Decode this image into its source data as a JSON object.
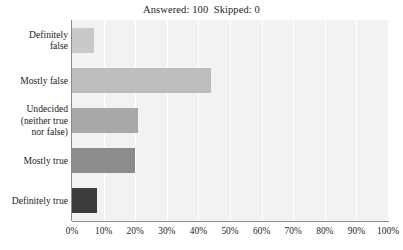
{
  "chart_data": {
    "type": "bar",
    "orientation": "horizontal",
    "title": "Answered: 100  Skipped: 0",
    "xlabel": "",
    "ylabel": "",
    "xlim": [
      0,
      100
    ],
    "grid": true,
    "legend": false,
    "categories": [
      "Definitely false",
      "Mostly false",
      "Undecided (neither true nor false)",
      "Mostly true",
      "Definitely true"
    ],
    "category_lines": [
      [
        "Definitely",
        "false"
      ],
      [
        "Mostly false"
      ],
      [
        "Undecided",
        "(neither true",
        "nor false)"
      ],
      [
        "Mostly true"
      ],
      [
        "Definitely true"
      ]
    ],
    "values": [
      7,
      44,
      21,
      20,
      8
    ],
    "bar_colors": [
      "#c9c9c9",
      "#bdbdbd",
      "#a8a8a8",
      "#8c8c8c",
      "#3c3c3c"
    ],
    "x_ticks": [
      0,
      10,
      20,
      30,
      40,
      50,
      60,
      70,
      80,
      90,
      100
    ],
    "x_tick_labels": [
      "0%",
      "10%",
      "20%",
      "30%",
      "40%",
      "50%",
      "60%",
      "70%",
      "80%",
      "90%",
      "100%"
    ],
    "plot_background": "#f2f2f2",
    "gridline_color": "#ffffff",
    "axis_color": "#8a8a8a"
  },
  "summary": {
    "answered_label": "Answered:",
    "answered_count": "100",
    "skipped_label": "Skipped:",
    "skipped_count": "0"
  }
}
